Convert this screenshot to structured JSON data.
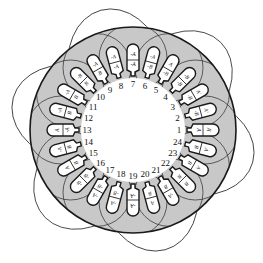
{
  "diagram": {
    "colors": {
      "background": "#ffffff",
      "stator_fill": "#c8c8c8",
      "slot_fill": "#ffffff",
      "line": "#1a1a1a",
      "coil": "#2a2a2a"
    },
    "geometry": {
      "cx": 133,
      "cy": 130,
      "outer_radius": 103,
      "bore_radius": 52,
      "slot_count": 24,
      "start_angle_deg": 0,
      "direction": "counterclockwise"
    },
    "slots": [
      {
        "number": "1",
        "outer": "A'",
        "inner": "A"
      },
      {
        "number": "2",
        "outer": "A'",
        "inner": "-B"
      },
      {
        "number": "3",
        "outer": "A'",
        "inner": "-B"
      },
      {
        "number": "4",
        "outer": "-B",
        "inner": "-B"
      },
      {
        "number": "5",
        "outer": "A",
        "inner": "-B"
      },
      {
        "number": "6",
        "outer": "-A",
        "inner": "-B"
      },
      {
        "number": "7",
        "outer": "-A",
        "inner": "-A"
      },
      {
        "number": "8",
        "outer": "-A",
        "inner": "-A"
      },
      {
        "number": "9",
        "outer": "-A",
        "inner": "B"
      },
      {
        "number": "10",
        "outer": "-B",
        "inner": "B"
      },
      {
        "number": "11",
        "outer": "-A",
        "inner": "B"
      },
      {
        "number": "12",
        "outer": "-A",
        "inner": "B"
      },
      {
        "number": "13",
        "outer": "A",
        "inner": "-A"
      },
      {
        "number": "14",
        "outer": "-A",
        "inner": "B"
      },
      {
        "number": "15",
        "outer": "A",
        "inner": "B"
      },
      {
        "number": "16",
        "outer": "-B",
        "inner": "-B"
      },
      {
        "number": "17",
        "outer": "-A",
        "inner": "-B"
      },
      {
        "number": "18",
        "outer": "-A",
        "inner": "-B"
      },
      {
        "number": "19",
        "outer": "-A",
        "inner": "-A"
      },
      {
        "number": "20",
        "outer": "A",
        "inner": "B"
      },
      {
        "number": "21",
        "outer": "-A",
        "inner": "B"
      },
      {
        "number": "22",
        "outer": "B",
        "inner": "B"
      },
      {
        "number": "23",
        "outer": "A",
        "inner": "B"
      },
      {
        "number": "24",
        "outer": "A",
        "inner": "B"
      }
    ]
  }
}
